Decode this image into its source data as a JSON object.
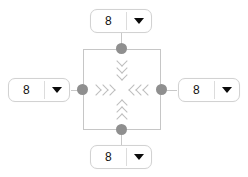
{
  "widget": {
    "name": "spacing-control",
    "center_box": {
      "label": "",
      "border_color": "#c6c6c6"
    },
    "handle_color": "#8f8f8f",
    "arrow_color": "#bdbdbd",
    "caret_color": "#0b0b0b"
  },
  "controls": {
    "top": {
      "value": "8",
      "caret_icon": "chevron-down-icon",
      "direction": "top"
    },
    "right": {
      "value": "8",
      "caret_icon": "chevron-down-icon",
      "direction": "right"
    },
    "bottom": {
      "value": "8",
      "caret_icon": "chevron-down-icon",
      "direction": "bottom"
    },
    "left": {
      "value": "8",
      "caret_icon": "chevron-down-icon",
      "direction": "left"
    }
  },
  "arrows": {
    "top": {
      "icon": "chevrons-down-icon",
      "count": 3
    },
    "bottom": {
      "icon": "chevrons-up-icon",
      "count": 3
    },
    "left": {
      "icon": "chevrons-right-icon",
      "count": 3
    },
    "right": {
      "icon": "chevrons-left-icon",
      "count": 3
    }
  }
}
